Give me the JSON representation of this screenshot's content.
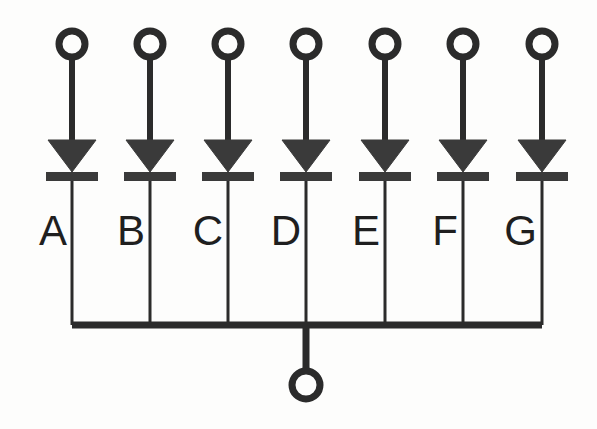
{
  "diagram": {
    "type": "circuit-schematic",
    "background_color": "#fdfdfc",
    "ink_color": "#2b2b2b",
    "fill_color": "#3a3a3a",
    "canvas": {
      "width": 597,
      "height": 429
    }
  },
  "geometry": {
    "branch_x": [
      72,
      150,
      228,
      306,
      385,
      463,
      542
    ],
    "terminal_cy": 44,
    "terminal_r": 13,
    "terminal_stroke": 7,
    "lead_top_y": 57,
    "triangle_top_y": 140,
    "triangle_apex_y": 172,
    "triangle_half_width": 24,
    "cathode_bar_y": 172,
    "cathode_bar_height": 9,
    "cathode_bar_half_width": 26,
    "label_y": 245,
    "bus_y": 325,
    "bus_stroke": 7,
    "bus_x_start": 72,
    "bus_x_end": 542,
    "wire_stroke": 3,
    "lead_stroke": 6,
    "output_x": 306,
    "output_drop_end_y": 371,
    "output_circle_cy": 385,
    "output_circle_r": 14,
    "output_circle_stroke": 7
  },
  "branches": [
    {
      "id": "a",
      "label": "A",
      "component": "led",
      "terminal": "anode-terminal-a"
    },
    {
      "id": "b",
      "label": "B",
      "component": "led",
      "terminal": "anode-terminal-b"
    },
    {
      "id": "c",
      "label": "C",
      "component": "led",
      "terminal": "anode-terminal-c"
    },
    {
      "id": "d",
      "label": "D",
      "component": "led",
      "terminal": "anode-terminal-d"
    },
    {
      "id": "e",
      "label": "E",
      "component": "led",
      "terminal": "anode-terminal-e"
    },
    {
      "id": "f",
      "label": "F",
      "component": "led",
      "terminal": "anode-terminal-f"
    },
    {
      "id": "g",
      "label": "G",
      "component": "led",
      "terminal": "anode-terminal-g"
    }
  ],
  "common_node": {
    "name": "common-cathode",
    "label": "",
    "terminal": "common-cathode-terminal"
  }
}
